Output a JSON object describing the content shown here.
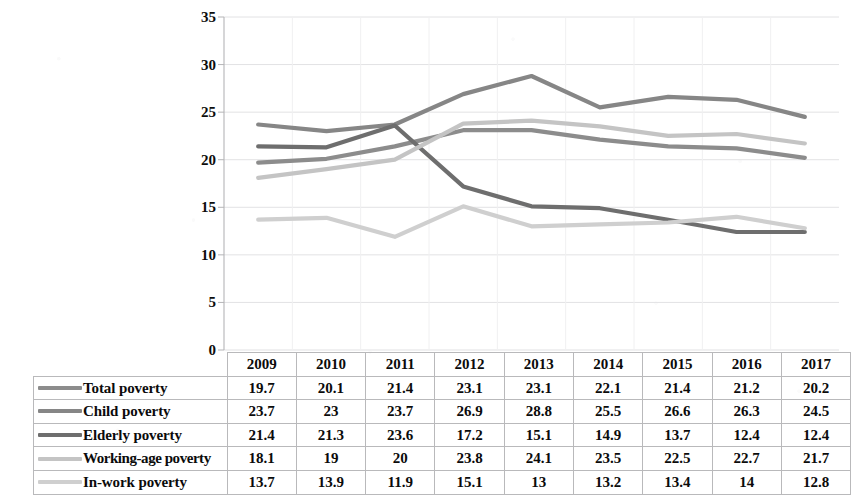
{
  "chart_data": {
    "type": "line",
    "title": "",
    "xlabel": "",
    "ylabel": "",
    "categories": [
      "2009",
      "2010",
      "2011",
      "2012",
      "2013",
      "2014",
      "2015",
      "2016",
      "2017"
    ],
    "ylim": [
      0,
      35
    ],
    "ytick_labels": [
      "0",
      "5",
      "10",
      "15",
      "20",
      "25",
      "30",
      "35"
    ],
    "ytick_values": [
      0,
      5,
      10,
      15,
      20,
      25,
      30,
      35
    ],
    "grid": true,
    "legend_position": "table-left",
    "series": [
      {
        "name": "Total poverty",
        "color": "#8c8c8c",
        "values": [
          19.7,
          20.1,
          21.4,
          23.1,
          23.1,
          22.1,
          21.4,
          21.2,
          20.2
        ]
      },
      {
        "name": "Child poverty",
        "color": "#868686",
        "values": [
          23.7,
          23,
          23.7,
          26.9,
          28.8,
          25.5,
          26.6,
          26.3,
          24.5
        ]
      },
      {
        "name": "Elderly poverty",
        "color": "#6e6e6e",
        "values": [
          21.4,
          21.3,
          23.6,
          17.2,
          15.1,
          14.9,
          13.7,
          12.4,
          12.4
        ]
      },
      {
        "name": "Working-age poverty",
        "color": "#c4c4c4",
        "values": [
          18.1,
          19,
          20,
          23.8,
          24.1,
          23.5,
          22.5,
          22.7,
          21.7
        ]
      },
      {
        "name": "In-work poverty",
        "color": "#cfcfcf",
        "values": [
          13.7,
          13.9,
          11.9,
          15.1,
          13,
          13.2,
          13.4,
          14,
          12.8
        ]
      }
    ]
  },
  "table": {
    "header": [
      "",
      "2009",
      "2010",
      "2011",
      "2012",
      "2013",
      "2014",
      "2015",
      "2016",
      "2017"
    ],
    "rows": [
      {
        "label": "Total poverty",
        "swatch_color": "#8c8c8c",
        "values": [
          "19.7",
          "20.1",
          "21.4",
          "23.1",
          "23.1",
          "22.1",
          "21.4",
          "21.2",
          "20.2"
        ]
      },
      {
        "label": "Child poverty",
        "swatch_color": "#868686",
        "values": [
          "23.7",
          "23",
          "23.7",
          "26.9",
          "28.8",
          "25.5",
          "26.6",
          "26.3",
          "24.5"
        ]
      },
      {
        "label": "Elderly poverty",
        "swatch_color": "#6e6e6e",
        "values": [
          "21.4",
          "21.3",
          "23.6",
          "17.2",
          "15.1",
          "14.9",
          "13.7",
          "12.4",
          "12.4"
        ]
      },
      {
        "label": "Working-age poverty",
        "swatch_color": "#c4c4c4",
        "values": [
          "18.1",
          "19",
          "20",
          "23.8",
          "24.1",
          "23.5",
          "22.5",
          "22.7",
          "21.7"
        ]
      },
      {
        "label": "In-work poverty",
        "swatch_color": "#cfcfcf",
        "values": [
          "13.7",
          "13.9",
          "11.9",
          "15.1",
          "13",
          "13.2",
          "13.4",
          "14",
          "12.8"
        ]
      }
    ]
  },
  "style": {
    "gridline_color": "#e2e2e4",
    "axis_color": "#b5b5b7",
    "table_border_color": "#b9b9bb",
    "background": "#ffffff"
  }
}
